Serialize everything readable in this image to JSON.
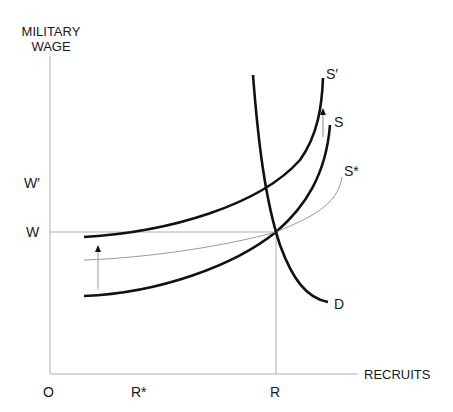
{
  "axes": {
    "y_title_line1": "MILITARY",
    "y_title_line2": "WAGE",
    "x_title": "RECRUITS",
    "origin": "O"
  },
  "y_ticks": {
    "w_prime": "W′",
    "w": "W"
  },
  "x_ticks": {
    "r_star": "R*",
    "r": "R"
  },
  "curves": {
    "s_prime": "S′",
    "s": "S",
    "s_star": "S*",
    "d": "D"
  },
  "colors": {
    "curve": "#111111",
    "thin": "#9a9a9a",
    "axis": "#b0b0b0"
  }
}
